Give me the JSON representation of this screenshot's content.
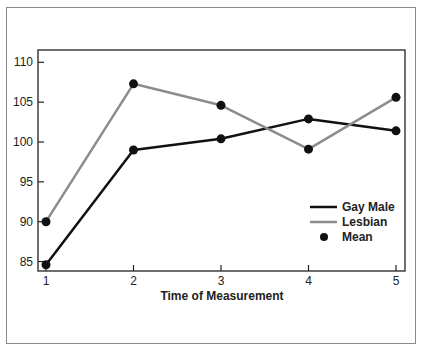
{
  "chart_data": {
    "type": "line",
    "title": "",
    "xlabel": "Time of Measurement",
    "ylabel": "",
    "x": [
      1,
      2,
      3,
      4,
      5
    ],
    "xticks": [
      "1",
      "2",
      "3",
      "4",
      "5"
    ],
    "yticks": [
      "85",
      "90",
      "95",
      "100",
      "105",
      "110"
    ],
    "ylim": [
      84,
      112
    ],
    "grid": false,
    "legend_position": "lower right inside",
    "series": [
      {
        "name": "Gay Male",
        "color": "#111111",
        "values": [
          84.6,
          99.0,
          100.4,
          102.9,
          101.4
        ]
      },
      {
        "name": "Lesbian",
        "color": "#8c8c8c",
        "values": [
          90.0,
          107.3,
          104.6,
          99.1,
          105.6
        ]
      }
    ],
    "markers": {
      "name": "Mean",
      "color": "#111111"
    }
  },
  "legend": {
    "items": [
      {
        "label": "Gay Male"
      },
      {
        "label": "Lesbian"
      },
      {
        "label": "Mean"
      }
    ]
  }
}
